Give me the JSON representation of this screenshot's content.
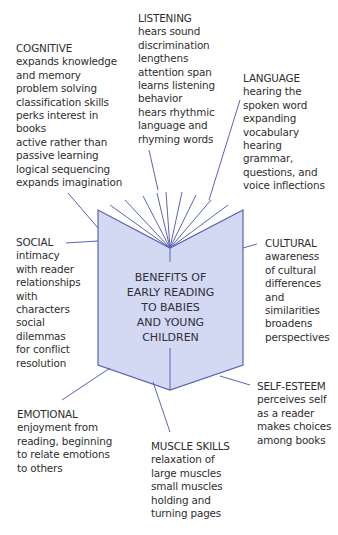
{
  "center": {
    "lines": [
      "BENEFITS OF",
      "EARLY READING",
      "TO BABIES",
      "AND YOUNG",
      "CHILDREN"
    ]
  },
  "colors": {
    "book_fill": "#d3d8f3",
    "book_stroke": "#5a63b8",
    "line": "#5a63b8",
    "text": "#2e2e2e"
  },
  "categories": {
    "cognitive": {
      "title": "COGNITIVE",
      "items": [
        "expands knowledge",
        "and memory",
        "problem solving",
        "classification skills",
        "perks interest in",
        "books",
        "active rather than",
        "passive learning",
        "logical sequencing",
        "expands imagination"
      ]
    },
    "listening": {
      "title": "LISTENING",
      "items": [
        "hears sound",
        "discrimination",
        "lengthens",
        "attention span",
        "learns listening",
        "behavior",
        "hears rhythmic",
        "language and",
        "rhyming words"
      ]
    },
    "language": {
      "title": "LANGUAGE",
      "items": [
        "hearing the",
        "spoken word",
        "expanding",
        "vocabulary",
        "hearing",
        "grammar,",
        "questions, and",
        "voice inflections"
      ]
    },
    "social": {
      "title": "SOCIAL",
      "items": [
        "intimacy",
        "with reader",
        "relationships",
        "with",
        "characters",
        "social",
        "dilemmas",
        "for conflict",
        "resolution"
      ]
    },
    "cultural": {
      "title": "CULTURAL",
      "items": [
        "awareness",
        "of cultural",
        "differences",
        "and",
        "similarities",
        "broadens",
        "perspectives"
      ]
    },
    "self_esteem": {
      "title": "SELF-ESTEEM",
      "items": [
        "perceives self",
        "as a reader",
        "makes choices",
        "among books"
      ]
    },
    "emotional": {
      "title": "EMOTIONAL",
      "items": [
        "enjoyment from",
        "reading, beginning",
        "to relate emotions",
        "to others"
      ]
    },
    "muscle_skills": {
      "title": "MUSCLE SKILLS",
      "items": [
        "relaxation of",
        "large muscles",
        "small muscles",
        "holding and",
        "turning pages"
      ]
    }
  }
}
